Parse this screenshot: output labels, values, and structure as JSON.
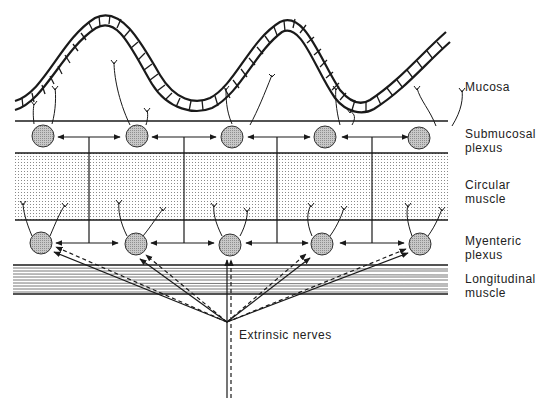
{
  "diagram": {
    "labels": {
      "mucosa": "Mucosa",
      "submucosal_line1": "Submucosal",
      "submucosal_line2": "plexus",
      "circular_line1": "Circular",
      "circular_line2": "muscle",
      "myenteric_line1": "Myenteric",
      "myenteric_line2": "plexus",
      "longitudinal_line1": "Longitudinal",
      "longitudinal_line2": "muscle",
      "extrinsic": "Extrinsic nerves"
    },
    "layers": [
      {
        "name": "Mucosa",
        "style": "wavy epithelium band"
      },
      {
        "name": "Submucosal plexus",
        "ganglia_count": 5
      },
      {
        "name": "Circular muscle",
        "style": "stippled"
      },
      {
        "name": "Myenteric plexus",
        "ganglia_count": 5
      },
      {
        "name": "Longitudinal muscle",
        "style": "horizontal hatching"
      }
    ],
    "colors": {
      "line": "#1a1a1a",
      "ganglion_fill": "#b5b5b5",
      "stipple": "#9a9a9a",
      "hatch": "#555555",
      "background": "#ffffff"
    }
  }
}
